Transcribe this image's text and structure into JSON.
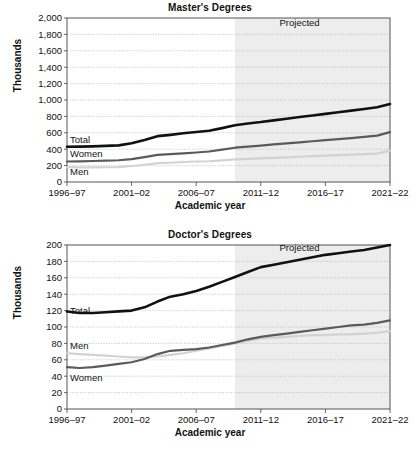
{
  "figure": {
    "background": "#ffffff",
    "panels": [
      "master",
      "doctor"
    ]
  },
  "master": {
    "title": "Master's Degrees",
    "ylabel": "Thousands",
    "xlabel": "Academic year",
    "projected_label": "Projected",
    "series_labels": {
      "total": "Total",
      "women": "Women",
      "men": "Men"
    },
    "yticks": [
      "0",
      "200",
      "400",
      "600",
      "800",
      "1,000",
      "1,200",
      "1,400",
      "1,600",
      "1,800",
      "2,000"
    ],
    "xticks": [
      "1996–97",
      "2001–02",
      "2006–07",
      "2011–12",
      "2016–17",
      "2021–22"
    ]
  },
  "doctor": {
    "title": "Doctor's Degrees",
    "ylabel": "Thousands",
    "xlabel": "Academic year",
    "projected_label": "Projected",
    "series_labels": {
      "total": "Total",
      "men": "Men",
      "women": "Women"
    },
    "yticks": [
      "0",
      "20",
      "40",
      "60",
      "80",
      "100",
      "120",
      "140",
      "160",
      "180",
      "200"
    ],
    "xticks": [
      "1996–97",
      "2001–02",
      "2006–07",
      "2011–12",
      "2016–17",
      "2021–22"
    ]
  },
  "colors": {
    "total": "#111111",
    "women_master": "#5a5a5a",
    "men_master": "#d2d2d2",
    "men_doctor": "#d2d2d2",
    "women_doctor": "#5a5a5a",
    "grid": "#b5b5b5",
    "axis": "#555555",
    "projected_band": "#ededed",
    "text": "#111111"
  },
  "chart_data": [
    {
      "type": "line",
      "title": "Master's Degrees",
      "xlabel": "Academic year",
      "ylabel": "Thousands",
      "ylim": [
        0,
        2000
      ],
      "ytick_step": 200,
      "grid": true,
      "legend": "inline-labels",
      "projection_starts": "2009-10",
      "annotations": [
        {
          "text": "Projected",
          "x": "2014-15",
          "y": 1900
        }
      ],
      "x": [
        "1996-97",
        "1997-98",
        "1998-99",
        "1999-00",
        "2000-01",
        "2001-02",
        "2002-03",
        "2003-04",
        "2004-05",
        "2005-06",
        "2006-07",
        "2007-08",
        "2008-09",
        "2009-10",
        "2010-11",
        "2011-12",
        "2012-13",
        "2013-14",
        "2014-15",
        "2015-16",
        "2016-17",
        "2017-18",
        "2018-19",
        "2019-20",
        "2020-21",
        "2021-22"
      ],
      "xtick_labels": [
        "1996-97",
        "2001-02",
        "2006-07",
        "2011-12",
        "2016-17",
        "2021-22"
      ],
      "series": [
        {
          "name": "Total",
          "color": "#111111",
          "values": [
            430,
            431,
            435,
            440,
            447,
            473,
            513,
            559,
            575,
            594,
            610,
            625,
            657,
            693,
            714,
            731,
            752,
            772,
            792,
            812,
            831,
            851,
            870,
            890,
            912,
            950
          ]
        },
        {
          "name": "Women",
          "color": "#5a5a5a",
          "values": [
            250,
            252,
            256,
            260,
            265,
            278,
            303,
            330,
            340,
            350,
            360,
            372,
            394,
            418,
            432,
            444,
            458,
            471,
            484,
            497,
            510,
            523,
            536,
            550,
            566,
            608
          ]
        },
        {
          "name": "Men",
          "color": "#d2d2d2",
          "values": [
            180,
            179,
            179,
            180,
            182,
            195,
            210,
            229,
            235,
            244,
            250,
            253,
            263,
            275,
            282,
            287,
            294,
            301,
            308,
            315,
            321,
            328,
            334,
            340,
            346,
            380
          ]
        }
      ]
    },
    {
      "type": "line",
      "title": "Doctor's Degrees",
      "xlabel": "Academic year",
      "ylabel": "Thousands",
      "ylim": [
        0,
        200
      ],
      "ytick_step": 20,
      "grid": true,
      "legend": "inline-labels",
      "projection_starts": "2009-10",
      "annotations": [
        {
          "text": "Projected",
          "x": "2014-15",
          "y": 193
        }
      ],
      "x": [
        "1996-97",
        "1997-98",
        "1998-99",
        "1999-00",
        "2000-01",
        "2001-02",
        "2002-03",
        "2003-04",
        "2004-05",
        "2005-06",
        "2006-07",
        "2007-08",
        "2008-09",
        "2009-10",
        "2010-11",
        "2011-12",
        "2012-13",
        "2013-14",
        "2014-15",
        "2015-16",
        "2016-17",
        "2017-18",
        "2018-19",
        "2019-20",
        "2020-21",
        "2021-22"
      ],
      "xtick_labels": [
        "1996-97",
        "2001-02",
        "2006-07",
        "2011-12",
        "2016-17",
        "2021-22"
      ],
      "series": [
        {
          "name": "Total",
          "color": "#111111",
          "values": [
            119,
            117,
            117,
            118,
            119,
            120,
            124,
            131,
            137,
            140,
            144,
            149,
            155,
            161,
            167,
            173,
            176,
            179,
            182,
            185,
            188,
            190,
            192,
            194,
            197,
            200
          ]
        },
        {
          "name": "Men",
          "color": "#d2d2d2",
          "values": [
            68,
            67,
            66,
            65,
            64,
            63,
            63,
            64,
            66,
            68,
            71,
            74,
            77,
            80,
            83,
            86,
            87,
            88,
            89,
            90,
            90,
            91,
            91,
            92,
            93,
            95
          ]
        },
        {
          "name": "Women",
          "color": "#5a5a5a",
          "values": [
            51,
            50,
            51,
            53,
            55,
            57,
            61,
            67,
            71,
            72,
            73,
            75,
            78,
            81,
            85,
            88,
            90,
            92,
            94,
            96,
            98,
            100,
            102,
            103,
            105,
            108
          ]
        }
      ]
    }
  ]
}
